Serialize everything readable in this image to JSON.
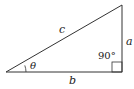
{
  "diagram": {
    "type": "right-triangle",
    "labels": {
      "hypotenuse": "c",
      "opposite": "a",
      "adjacent": "b",
      "angle": "θ",
      "right_angle": "90°"
    },
    "colors": {
      "stroke": "#333333",
      "background": "#ffffff"
    }
  }
}
